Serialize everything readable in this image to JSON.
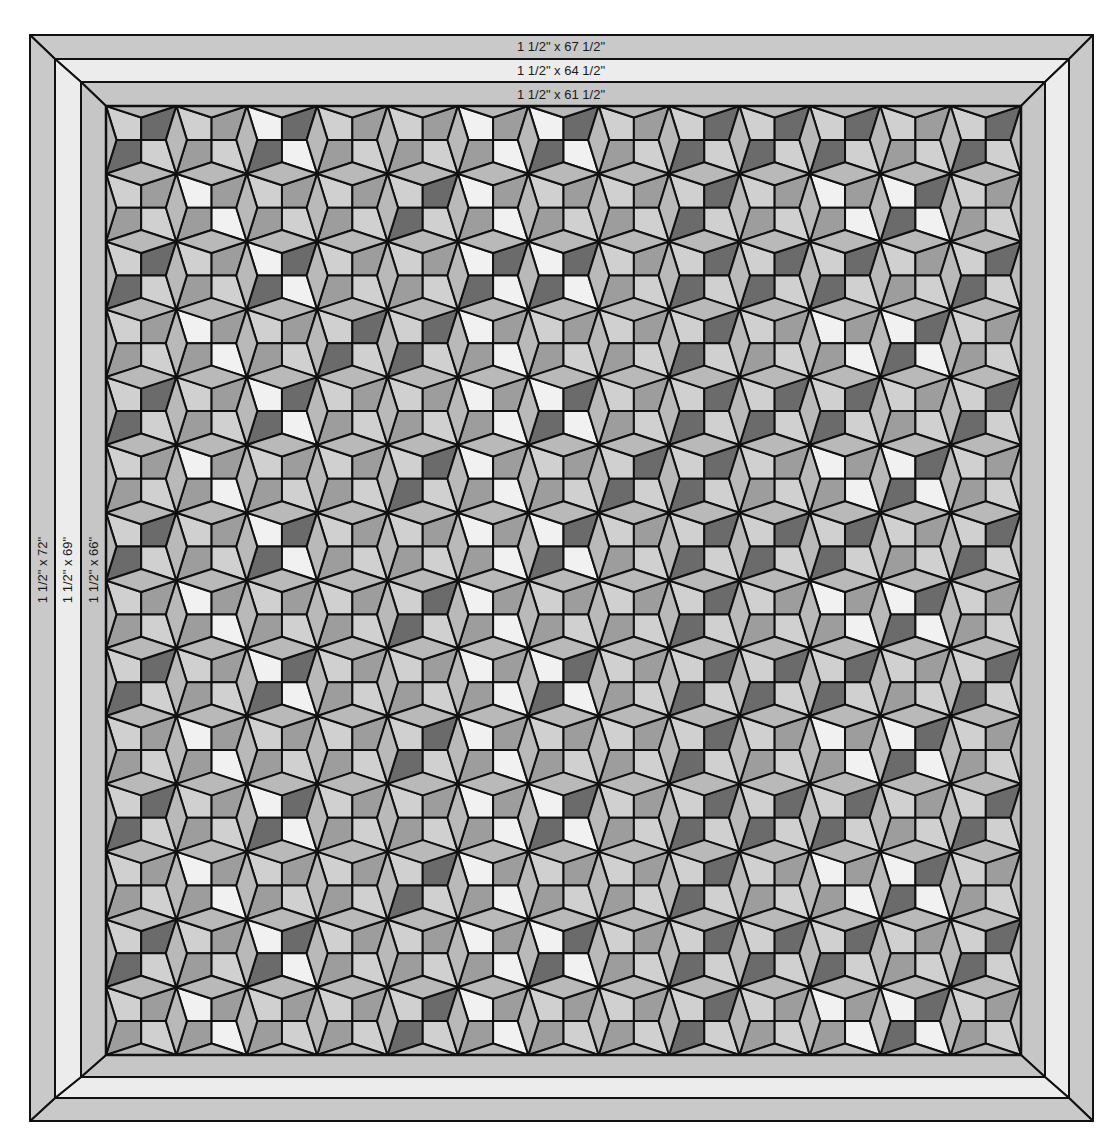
{
  "diagram": {
    "type": "quilt-layout",
    "borders": [
      {
        "name": "outer-border",
        "top_label": "1 1/2\" x 67 1/2\"",
        "side_label": "1 1/2\" x 72\"",
        "rect": [
          30,
          35,
          1093,
          1121
        ],
        "fill": "#c9c9c9"
      },
      {
        "name": "middle-border",
        "top_label": "1 1/2\" x 64 1/2\"",
        "side_label": "1 1/2\" x 69\"",
        "rect": [
          55,
          59,
          1069,
          1098
        ],
        "fill": "#ececec"
      },
      {
        "name": "inner-border",
        "top_label": "1 1/2\" x 61 1/2\"",
        "side_label": "1 1/2\" x 66\"",
        "rect": [
          81,
          82,
          1045,
          1077
        ],
        "fill": "#c6c6c6"
      }
    ],
    "quilt_center": {
      "rect": [
        106,
        106,
        1021,
        1055
      ],
      "columns": 13,
      "rows": 14,
      "diamond_fill": "#b9b9b9",
      "diamond_h_half": 11.5,
      "diamond_v_half": 10.5,
      "line_color": "#111111",
      "shades": {
        "W": "#f1f1f1",
        "L": "#d0d0d0",
        "M": "#9d9d9d",
        "D": "#6b6b6b"
      },
      "blocks": [
        [
          "LD",
          "LM",
          "WD",
          "LM",
          "LM",
          "WM",
          "WD",
          "LM",
          "LD",
          "LD",
          "LD",
          "LM",
          "LD"
        ],
        [
          "LM",
          "WM",
          "LM",
          "LM",
          "LD",
          "WM",
          "LM",
          "LM",
          "LD",
          "LM",
          "WM",
          "WD",
          "LM"
        ],
        [
          "LD",
          "LM",
          "WD",
          "LM",
          "LM",
          "WD",
          "WD",
          "LM",
          "LD",
          "LD",
          "LD",
          "LM",
          "LD"
        ],
        [
          "LM",
          "WM",
          "LM",
          "LD",
          "LD",
          "WM",
          "LM",
          "LM",
          "LD",
          "LM",
          "WM",
          "WD",
          "LM"
        ],
        [
          "LD",
          "LM",
          "WD",
          "LM",
          "LM",
          "WM",
          "WD",
          "LM",
          "LD",
          "LD",
          "LD",
          "LM",
          "LD"
        ],
        [
          "LM",
          "WM",
          "LM",
          "LM",
          "LD",
          "WM",
          "LM",
          "LD",
          "LD",
          "LM",
          "WM",
          "WD",
          "LM"
        ],
        [
          "LD",
          "LM",
          "WD",
          "LM",
          "LM",
          "WM",
          "WD",
          "LM",
          "LD",
          "LD",
          "LD",
          "LM",
          "LD"
        ],
        [
          "LM",
          "WM",
          "LM",
          "LM",
          "LD",
          "WM",
          "LM",
          "LM",
          "LD",
          "LM",
          "WM",
          "WD",
          "LM"
        ],
        [
          "LD",
          "LM",
          "WD",
          "LM",
          "LM",
          "WM",
          "WD",
          "LM",
          "LD",
          "LD",
          "LD",
          "LM",
          "LD"
        ],
        [
          "LM",
          "WM",
          "LM",
          "LM",
          "LD",
          "WM",
          "LM",
          "LM",
          "LD",
          "LM",
          "WM",
          "WD",
          "LM"
        ],
        [
          "LD",
          "LM",
          "WD",
          "LM",
          "LM",
          "WM",
          "WD",
          "LM",
          "LD",
          "LD",
          "LD",
          "LM",
          "LD"
        ],
        [
          "LM",
          "WM",
          "LM",
          "LM",
          "LD",
          "WM",
          "LM",
          "LM",
          "LD",
          "LM",
          "WM",
          "WD",
          "LM"
        ],
        [
          "LD",
          "LM",
          "WD",
          "LM",
          "LM",
          "WM",
          "WD",
          "LM",
          "LD",
          "LD",
          "LD",
          "LM",
          "LD"
        ],
        [
          "LM",
          "WM",
          "LM",
          "LM",
          "LD",
          "WM",
          "LM",
          "LM",
          "LD",
          "LM",
          "WM",
          "WD",
          "LM"
        ]
      ]
    }
  }
}
